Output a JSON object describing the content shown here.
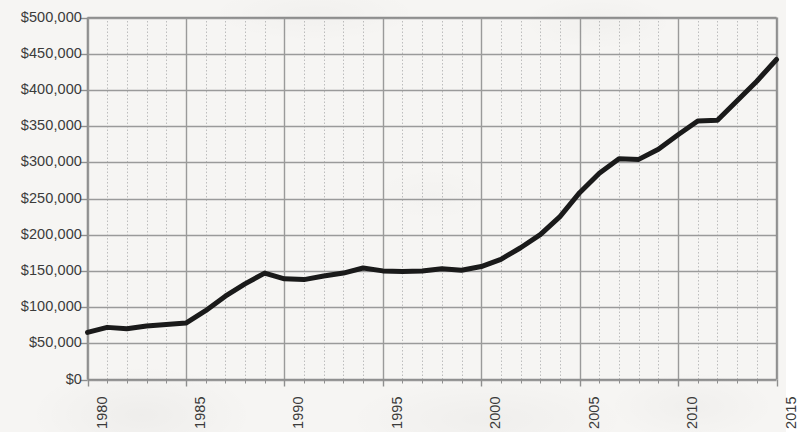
{
  "chart_data": {
    "type": "line",
    "title": "",
    "subtitle": "",
    "xlabel": "",
    "ylabel": "",
    "xlim": [
      1980,
      2015
    ],
    "ylim": [
      0,
      500000
    ],
    "y_tick_step": 50000,
    "x_major_tick_step": 5,
    "x_minor_tick_step": 1,
    "grid": "major horizontal solid, major vertical solid, minor vertical dotted",
    "legend": "none",
    "value_prefix": "$",
    "x": [
      1980,
      1981,
      1982,
      1983,
      1984,
      1985,
      1986,
      1987,
      1988,
      1989,
      1990,
      1991,
      1992,
      1993,
      1994,
      1995,
      1996,
      1997,
      1998,
      1999,
      2000,
      2001,
      2002,
      2003,
      2004,
      2005,
      2006,
      2007,
      2008,
      2009,
      2010,
      2011,
      2012,
      2013,
      2014,
      2015
    ],
    "series": [
      {
        "name": "Median price",
        "color": "#1a1a1a",
        "values": [
          65000,
          72000,
          70000,
          74000,
          76000,
          78000,
          95000,
          115000,
          132000,
          147000,
          139000,
          138000,
          143000,
          147000,
          154000,
          150000,
          149000,
          150000,
          153000,
          151000,
          156000,
          166000,
          182000,
          200000,
          225000,
          258000,
          285000,
          305000,
          304000,
          318000,
          338000,
          357000,
          358000,
          385000,
          412000,
          442000
        ]
      }
    ],
    "y_ticks": [
      {
        "value": 0,
        "label": "$0"
      },
      {
        "value": 50000,
        "label": "$50,000"
      },
      {
        "value": 100000,
        "label": "$100,000"
      },
      {
        "value": 150000,
        "label": "$150,000"
      },
      {
        "value": 200000,
        "label": "$200,000"
      },
      {
        "value": 250000,
        "label": "$250,000"
      },
      {
        "value": 300000,
        "label": "$300,000"
      },
      {
        "value": 350000,
        "label": "$350,000"
      },
      {
        "value": 400000,
        "label": "$400,000"
      },
      {
        "value": 450000,
        "label": "$450,000"
      },
      {
        "value": 500000,
        "label": "$500,000"
      }
    ],
    "x_ticks": [
      {
        "value": 1980,
        "label": "1980"
      },
      {
        "value": 1985,
        "label": "1985"
      },
      {
        "value": 1990,
        "label": "1990"
      },
      {
        "value": 1995,
        "label": "1995"
      },
      {
        "value": 2000,
        "label": "2000"
      },
      {
        "value": 2005,
        "label": "2005"
      },
      {
        "value": 2010,
        "label": "2010"
      },
      {
        "value": 2015,
        "label": "2015"
      }
    ],
    "style": {
      "background": "#f6f5f3",
      "axis_color": "#8f8f8f",
      "major_grid_color": "#9a9a9a",
      "minor_grid_color": "#bdbdbd",
      "line_color": "#1a1a1a",
      "line_width": 5,
      "tick_text_color": "#3b3b3b"
    }
  }
}
